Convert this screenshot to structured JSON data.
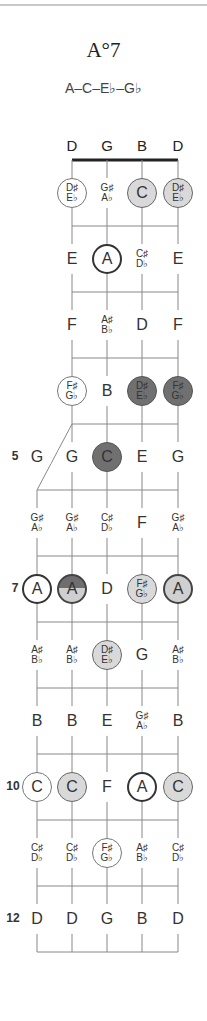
{
  "header": {
    "chord_name": "A°7",
    "chord_notes": "A–C–E♭–G♭"
  },
  "fretboard": {
    "string_names": [
      "D",
      "G",
      "B",
      "D"
    ],
    "fret_markers": [
      {
        "fret": 5,
        "label": "5"
      },
      {
        "fret": 7,
        "label": "7"
      },
      {
        "fret": 10,
        "label": "10"
      },
      {
        "fret": 12,
        "label": "12"
      }
    ],
    "rows": [
      {
        "fret": 1,
        "notes": [
          {
            "s": 1,
            "a": "D♯",
            "b": "E♭",
            "style": "c-white-thin"
          },
          {
            "s": 2,
            "a": "G♯",
            "b": "A♭",
            "style": "c-none"
          },
          {
            "s": 3,
            "a": "C",
            "style": "c-light"
          },
          {
            "s": 4,
            "a": "D♯",
            "b": "E♭",
            "style": "c-light"
          }
        ]
      },
      {
        "fret": 2,
        "notes": [
          {
            "s": 1,
            "a": "E",
            "style": "c-none"
          },
          {
            "s": 2,
            "a": "A",
            "style": "c-white-bold"
          },
          {
            "s": 3,
            "a": "C♯",
            "b": "D♭",
            "style": "c-none"
          },
          {
            "s": 4,
            "a": "E",
            "style": "c-none"
          }
        ]
      },
      {
        "fret": 3,
        "notes": [
          {
            "s": 1,
            "a": "F",
            "style": "c-none"
          },
          {
            "s": 2,
            "a": "A♯",
            "b": "B♭",
            "style": "c-none"
          },
          {
            "s": 3,
            "a": "D",
            "style": "c-none"
          },
          {
            "s": 4,
            "a": "F",
            "style": "c-none"
          }
        ]
      },
      {
        "fret": 4,
        "notes": [
          {
            "s": 1,
            "a": "F♯",
            "b": "G♭",
            "style": "c-white-thin"
          },
          {
            "s": 2,
            "a": "B",
            "style": "c-none"
          },
          {
            "s": 3,
            "a": "D♯",
            "b": "E♭",
            "style": "c-dark"
          },
          {
            "s": 4,
            "a": "F♯",
            "b": "G♭",
            "style": "c-dark"
          }
        ]
      },
      {
        "fret": 5,
        "notes": [
          {
            "s": 0,
            "a": "G",
            "style": "c-none"
          },
          {
            "s": 1,
            "a": "G",
            "style": "c-none"
          },
          {
            "s": 2,
            "a": "C",
            "style": "c-dark"
          },
          {
            "s": 3,
            "a": "E",
            "style": "c-none"
          },
          {
            "s": 4,
            "a": "G",
            "style": "c-none"
          }
        ]
      },
      {
        "fret": 6,
        "notes": [
          {
            "s": 0,
            "a": "G♯",
            "b": "A♭",
            "style": "c-none"
          },
          {
            "s": 1,
            "a": "G♯",
            "b": "A♭",
            "style": "c-none"
          },
          {
            "s": 2,
            "a": "C♯",
            "b": "D♭",
            "style": "c-none"
          },
          {
            "s": 3,
            "a": "F",
            "style": "c-none"
          },
          {
            "s": 4,
            "a": "G♯",
            "b": "A♭",
            "style": "c-none"
          }
        ]
      },
      {
        "fret": 7,
        "notes": [
          {
            "s": 0,
            "a": "A",
            "style": "c-white-bold"
          },
          {
            "s": 1,
            "a": "A",
            "style": "c-split"
          },
          {
            "s": 2,
            "a": "D",
            "style": "c-none"
          },
          {
            "s": 3,
            "a": "F♯",
            "b": "G♭",
            "style": "c-light"
          },
          {
            "s": 4,
            "a": "A",
            "style": "c-light-bold"
          }
        ]
      },
      {
        "fret": 8,
        "notes": [
          {
            "s": 0,
            "a": "A♯",
            "b": "B♭",
            "style": "c-none"
          },
          {
            "s": 1,
            "a": "A♯",
            "b": "B♭",
            "style": "c-none"
          },
          {
            "s": 2,
            "a": "D♯",
            "b": "E♭",
            "style": "c-light"
          },
          {
            "s": 3,
            "a": "G",
            "style": "c-none"
          },
          {
            "s": 4,
            "a": "A♯",
            "b": "B♭",
            "style": "c-none"
          }
        ]
      },
      {
        "fret": 9,
        "notes": [
          {
            "s": 0,
            "a": "B",
            "style": "c-none"
          },
          {
            "s": 1,
            "a": "B",
            "style": "c-none"
          },
          {
            "s": 2,
            "a": "E",
            "style": "c-none"
          },
          {
            "s": 3,
            "a": "G♯",
            "b": "A♭",
            "style": "c-none"
          },
          {
            "s": 4,
            "a": "B",
            "style": "c-none"
          }
        ]
      },
      {
        "fret": 10,
        "notes": [
          {
            "s": 0,
            "a": "C",
            "style": "c-white-thin"
          },
          {
            "s": 1,
            "a": "C",
            "style": "c-light"
          },
          {
            "s": 2,
            "a": "F",
            "style": "c-none"
          },
          {
            "s": 3,
            "a": "A",
            "style": "c-white-bold"
          },
          {
            "s": 4,
            "a": "C",
            "style": "c-light"
          }
        ]
      },
      {
        "fret": 11,
        "notes": [
          {
            "s": 0,
            "a": "C♯",
            "b": "D♭",
            "style": "c-none"
          },
          {
            "s": 1,
            "a": "C♯",
            "b": "D♭",
            "style": "c-none"
          },
          {
            "s": 2,
            "a": "F♯",
            "b": "G♭",
            "style": "c-white-thin"
          },
          {
            "s": 3,
            "a": "A♯",
            "b": "B♭",
            "style": "c-none"
          },
          {
            "s": 4,
            "a": "C♯",
            "b": "D♭",
            "style": "c-none"
          }
        ]
      },
      {
        "fret": 12,
        "notes": [
          {
            "s": 0,
            "a": "D",
            "style": "c-none"
          },
          {
            "s": 1,
            "a": "D",
            "style": "c-none"
          },
          {
            "s": 2,
            "a": "G",
            "style": "c-none"
          },
          {
            "s": 3,
            "a": "B",
            "style": "c-none"
          },
          {
            "s": 4,
            "a": "D",
            "style": "c-none"
          }
        ]
      }
    ]
  }
}
